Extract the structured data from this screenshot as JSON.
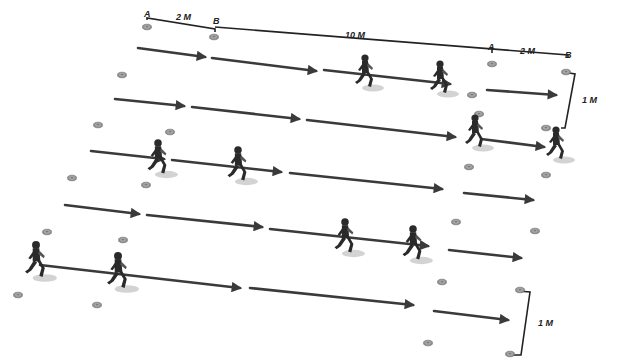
{
  "diagram": {
    "title": "Running drill: 2 M acceleration, 10 M run, 2 M finish zone; lanes 1 M apart",
    "colors": {
      "arrow": "#3a3a3a",
      "cone": "#9a9a9a",
      "cone_edge": "#6e6e6e",
      "runner": "#2a2a2a",
      "shadow": "#c8c8c8",
      "measure": "#222222"
    },
    "labels": {
      "top_a_left": "A",
      "top_2m_left": "2 M",
      "top_b_left": "B",
      "top_10m": "10 M",
      "top_a_right": "A",
      "top_2m_right": "2 M",
      "top_b_right": "B",
      "side_1m_top": "1 M",
      "side_1m_bottom": "1 M"
    },
    "measure_lines": [
      {
        "name": "measure-a-b-left",
        "points": [
          [
            147,
            20
          ],
          [
            147,
            18
          ],
          [
            215,
            29
          ],
          [
            215,
            32
          ]
        ]
      },
      {
        "name": "measure-b-to-b-top",
        "points": [
          [
            215,
            27
          ],
          [
            568,
            55
          ],
          [
            568,
            58
          ]
        ]
      },
      {
        "name": "measure-a-tick-right",
        "points": [
          [
            492,
            48
          ],
          [
            492,
            53
          ]
        ]
      },
      {
        "name": "measure-1m-top",
        "points": [
          [
            569,
            73
          ],
          [
            575,
            74
          ],
          [
            565,
            128
          ],
          [
            561,
            128
          ]
        ]
      },
      {
        "name": "measure-1m-bottom",
        "points": [
          [
            518,
            291
          ],
          [
            530,
            292
          ],
          [
            521,
            355
          ],
          [
            513,
            355
          ]
        ]
      }
    ],
    "lanes": [
      {
        "arrows": [
          [
            138,
            48,
            205,
            57
          ],
          [
            212,
            58,
            316,
            71
          ],
          [
            324,
            70,
            450,
            84
          ],
          [
            487,
            90,
            556,
            95
          ]
        ]
      },
      {
        "arrows": [
          [
            115,
            99,
            184,
            106
          ],
          [
            192,
            107,
            299,
            119
          ],
          [
            307,
            120,
            455,
            137
          ],
          [
            481,
            139,
            544,
            147
          ]
        ]
      },
      {
        "arrows": [
          [
            91,
            151,
            164,
            159
          ],
          [
            172,
            160,
            281,
            172
          ],
          [
            290,
            173,
            442,
            189
          ],
          [
            464,
            193,
            533,
            200
          ]
        ]
      },
      {
        "arrows": [
          [
            65,
            205,
            139,
            214
          ],
          [
            147,
            215,
            262,
            227
          ],
          [
            270,
            229,
            428,
            246
          ],
          [
            449,
            250,
            521,
            258
          ]
        ]
      },
      {
        "arrows": [
          [
            40,
            265,
            240,
            288
          ],
          [
            250,
            288,
            413,
            305
          ],
          [
            434,
            311,
            508,
            320
          ]
        ]
      }
    ],
    "cones": [
      [
        147,
        27
      ],
      [
        214,
        37
      ],
      [
        492,
        64
      ],
      [
        566,
        72
      ],
      [
        122,
        75
      ],
      [
        472,
        95
      ],
      [
        98,
        125
      ],
      [
        170,
        132
      ],
      [
        479,
        114
      ],
      [
        546,
        128
      ],
      [
        72,
        178
      ],
      [
        146,
        185
      ],
      [
        469,
        167
      ],
      [
        546,
        175
      ],
      [
        47,
        232
      ],
      [
        123,
        240
      ],
      [
        456,
        222
      ],
      [
        535,
        231
      ],
      [
        18,
        295
      ],
      [
        97,
        305
      ],
      [
        442,
        282
      ],
      [
        520,
        290
      ],
      [
        428,
        343
      ],
      [
        510,
        354
      ]
    ],
    "runners": [
      {
        "name": "runner-lane1-a",
        "x": 365,
        "y": 58,
        "scale": 1.0
      },
      {
        "name": "runner-lane1-b",
        "x": 440,
        "y": 64,
        "scale": 1.0
      },
      {
        "name": "runner-lane2-a",
        "x": 475,
        "y": 118,
        "scale": 1.0
      },
      {
        "name": "runner-lane2-b",
        "x": 556,
        "y": 130,
        "scale": 1.0
      },
      {
        "name": "runner-lane3-a",
        "x": 158,
        "y": 143,
        "scale": 1.05
      },
      {
        "name": "runner-lane3-b",
        "x": 238,
        "y": 150,
        "scale": 1.05
      },
      {
        "name": "runner-lane4-a",
        "x": 345,
        "y": 222,
        "scale": 1.05
      },
      {
        "name": "runner-lane4-b",
        "x": 413,
        "y": 229,
        "scale": 1.05
      },
      {
        "name": "runner-lane5-a",
        "x": 36,
        "y": 245,
        "scale": 1.1
      },
      {
        "name": "runner-lane5-b",
        "x": 118,
        "y": 256,
        "scale": 1.1
      }
    ]
  }
}
